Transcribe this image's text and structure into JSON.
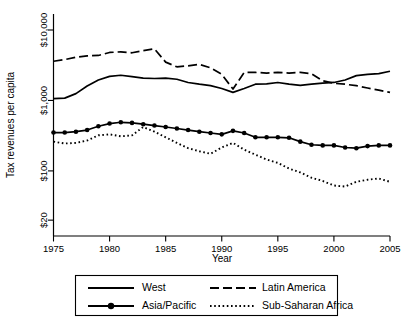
{
  "chart_data": {
    "type": "line",
    "title": "",
    "xlabel": "Year",
    "ylabel": "Tax revenues per capita",
    "xlim": [
      1975,
      2005
    ],
    "ylim": [
      20,
      10000
    ],
    "yscale": "log",
    "grid": false,
    "legend_position": "bottom",
    "xticks": [
      1975,
      1980,
      1985,
      1990,
      1995,
      2000,
      2005
    ],
    "xticklabels": [
      "1975",
      "1980",
      "1985",
      "1990",
      "1995",
      "2000",
      "2005"
    ],
    "yticks": [
      20,
      100,
      1000,
      10000
    ],
    "yticklabels": [
      "$20",
      "$100",
      "$1,000",
      "$10,000"
    ],
    "x": [
      1975,
      1976,
      1977,
      1978,
      1979,
      1980,
      1981,
      1982,
      1983,
      1984,
      1985,
      1986,
      1987,
      1988,
      1989,
      1990,
      1991,
      1992,
      1993,
      1994,
      1995,
      1996,
      1997,
      1998,
      1999,
      2000,
      2001,
      2002,
      2003,
      2004,
      2005
    ],
    "series": [
      {
        "name": "West",
        "style": "solid",
        "marker": "none",
        "color": "#000000",
        "values": [
          1060,
          1080,
          1250,
          1600,
          1950,
          2200,
          2280,
          2180,
          2080,
          2050,
          2080,
          2000,
          1800,
          1700,
          1620,
          1480,
          1300,
          1480,
          1700,
          1720,
          1800,
          1700,
          1640,
          1700,
          1760,
          1800,
          1950,
          2250,
          2350,
          2400,
          2600
        ]
      },
      {
        "name": "Latin America",
        "style": "dashed",
        "marker": "none",
        "color": "#000000",
        "values": [
          3600,
          3800,
          4100,
          4300,
          4350,
          4800,
          4900,
          4750,
          5100,
          5400,
          3500,
          3000,
          3100,
          3250,
          2900,
          2350,
          1450,
          2500,
          2500,
          2450,
          2500,
          2450,
          2500,
          2400,
          1900,
          1750,
          1700,
          1620,
          1500,
          1400,
          1300
        ]
      },
      {
        "name": "Asia/Pacific",
        "style": "solid",
        "marker": "circle",
        "color": "#000000",
        "values": [
          350,
          350,
          360,
          380,
          430,
          470,
          490,
          480,
          460,
          440,
          420,
          400,
          380,
          360,
          345,
          330,
          370,
          345,
          300,
          300,
          300,
          295,
          260,
          235,
          230,
          230,
          215,
          210,
          225,
          230,
          230
        ]
      },
      {
        "name": "Sub-Saharan Africa",
        "style": "dotted",
        "marker": "none",
        "color": "#000000",
        "values": [
          260,
          245,
          250,
          270,
          320,
          330,
          310,
          320,
          420,
          360,
          300,
          250,
          210,
          190,
          175,
          215,
          250,
          200,
          170,
          145,
          130,
          108,
          95,
          80,
          72,
          62,
          60,
          70,
          75,
          78,
          70
        ]
      }
    ]
  },
  "legend": {
    "entries": [
      {
        "label": "West",
        "style": "solid",
        "marker": "none"
      },
      {
        "label": "Latin America",
        "style": "dashed",
        "marker": "none"
      },
      {
        "label": "Asia/Pacific",
        "style": "solid",
        "marker": "circle"
      },
      {
        "label": "Sub-Saharan Africa",
        "style": "dotted",
        "marker": "none"
      }
    ]
  }
}
